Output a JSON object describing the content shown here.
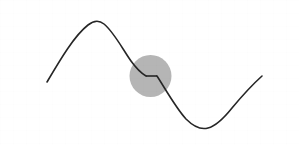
{
  "figure": {
    "width": 299,
    "height": 145,
    "background_color": "#ffffff"
  },
  "colors": {
    "curve": "#262626",
    "highlight_disc": "#b5b5b5",
    "background": "#ffffff"
  },
  "highlight": {
    "shape": "circle",
    "center_x": 150.5,
    "center_y": 76,
    "radius": 21,
    "fill": "#b5b5b5",
    "label": "discontinuity-highlight"
  },
  "curve": {
    "stroke_width": 1.6,
    "stroke": "#262626",
    "start_point": [
      47,
      82
    ],
    "peak_point": [
      98,
      21
    ],
    "trough_point": [
      208,
      128
    ],
    "end_point": [
      262,
      76
    ],
    "step": {
      "description": "horizontal plateau step discontinuity",
      "corner_left": [
        146,
        76
      ],
      "corner_right": [
        157,
        76
      ],
      "plateau_y": 76
    },
    "path_segment_rising": "M47,82 C60,60 74,36 88,25 C93,21 99,20 104,24 C113,31 122,48 131,61 C136,68 141,73 146,76",
    "path_segment_plateau": "M146,76 L157,76",
    "path_segment_falling": "M157,76 C166,90 176,108 186,119 C193,126 201,130 208,128 C216,126 224,118 232,108 C242,96 252,85 262,76"
  },
  "chart_data": {
    "type": "line",
    "title": "",
    "xlabel": "",
    "ylabel": "",
    "grid": false,
    "legend": null,
    "xlim": [
      47,
      262
    ],
    "ylim": [
      21,
      128
    ],
    "annotations": [
      {
        "type": "circle-highlight",
        "x": 150.5,
        "y": 76,
        "radius": 21,
        "note": "step discontinuity"
      }
    ],
    "series": [
      {
        "name": "curve",
        "x": [
          47,
          60,
          74,
          88,
          98,
          104,
          113,
          122,
          131,
          138,
          146,
          157,
          166,
          176,
          186,
          196,
          208,
          220,
          232,
          244,
          252,
          262
        ],
        "y": [
          82,
          60,
          36,
          25,
          21,
          24,
          31,
          48,
          61,
          69,
          76,
          76,
          90,
          108,
          119,
          125,
          128,
          123,
          108,
          92,
          85,
          76
        ]
      }
    ]
  }
}
